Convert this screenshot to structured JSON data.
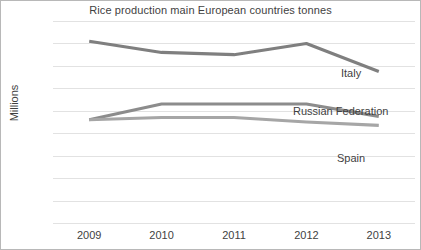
{
  "chart_data": {
    "type": "line",
    "title": "Rice production main European countries tonnes",
    "xlabel": "",
    "ylabel": "Millions",
    "categories": [
      "2009",
      "2010",
      "2011",
      "2012",
      "2013"
    ],
    "ylim": [
      0,
      1.8
    ],
    "y_ticks": [
      "0",
      "0.2",
      "0.4",
      "0.6",
      "0.8",
      "1",
      "1.2",
      "1.4",
      "1.6",
      "1.8"
    ],
    "y_tick_values": [
      0,
      0.2,
      0.4,
      0.6,
      0.8,
      1.0,
      1.2,
      1.4,
      1.6,
      1.8
    ],
    "grid": "horizontal",
    "legend_position": "inline-right-labels",
    "series": [
      {
        "name": "Italy",
        "color": "#7f7f7f",
        "values": [
          1.62,
          1.52,
          1.5,
          1.6,
          1.35
        ]
      },
      {
        "name": "Russian Federation",
        "color": "#8c8c8c",
        "values": [
          0.92,
          1.06,
          1.06,
          1.06,
          0.95
        ]
      },
      {
        "name": "Spain",
        "color": "#a6a6a6",
        "values": [
          0.92,
          0.94,
          0.94,
          0.9,
          0.87
        ]
      }
    ]
  }
}
